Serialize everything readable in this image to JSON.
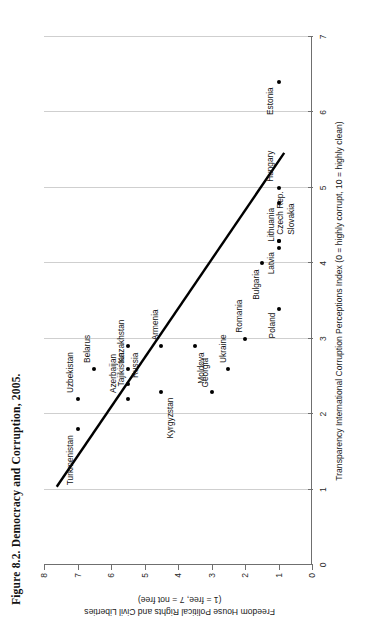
{
  "figure": {
    "title": "Figure 8.2.  Democracy and Corruption, 2005."
  },
  "chart_data": {
    "type": "scatter",
    "title": "Figure 8.2.  Democracy and Corruption, 2005.",
    "xlabel": "Transparency International Corruption Perceptions Index (0 = highly corrupt, 10 = highly clean)",
    "ylabel_line1": "Freedom House Political Rights and Civil Liberties",
    "ylabel_line2": "(1 = free, 7 = not free)",
    "xlim": [
      0,
      7
    ],
    "ylim": [
      0,
      8
    ],
    "y_inverted": false,
    "grid": "vertical",
    "legend": "none",
    "xticks": [
      0,
      1,
      2,
      3,
      4,
      5,
      6,
      7
    ],
    "yticks": [
      0,
      1,
      2,
      3,
      4,
      5,
      6,
      7,
      8
    ],
    "xticklabels": [
      "0",
      "1",
      "2",
      "3",
      "4",
      "5",
      "6",
      "7"
    ],
    "yticklabels": [
      "0",
      "1",
      "2",
      "3",
      "4",
      "5",
      "6",
      "7",
      "8"
    ],
    "points": [
      {
        "label": "Turkmenistan",
        "x": 1.8,
        "y": 7.0,
        "lx": -6,
        "ly": -13,
        "anchor": "end"
      },
      {
        "label": "Uzbekistan",
        "x": 2.2,
        "y": 7.0,
        "lx": 6,
        "ly": -13,
        "anchor": "start"
      },
      {
        "label": "Belarus",
        "x": 2.6,
        "y": 6.5,
        "lx": 6,
        "ly": -12,
        "anchor": "start"
      },
      {
        "label": "Tajikistan",
        "x": 2.9,
        "y": 5.5,
        "lx": -6,
        "ly": -12,
        "anchor": "end"
      },
      {
        "label": "Azerbaijan",
        "x": 2.2,
        "y": 5.5,
        "lx": 6,
        "ly": -20,
        "anchor": "start"
      },
      {
        "label": "Kazakhstan",
        "x": 2.6,
        "y": 5.5,
        "lx": 6,
        "ly": -12,
        "anchor": "start"
      },
      {
        "label": "Russia",
        "x": 2.4,
        "y": 5.5,
        "lx": 6,
        "ly": 2,
        "anchor": "start"
      },
      {
        "label": "Armenia",
        "x": 2.9,
        "y": 4.5,
        "lx": 6,
        "ly": -11,
        "anchor": "start"
      },
      {
        "label": "Kyrgyzstan",
        "x": 2.3,
        "y": 4.5,
        "lx": -6,
        "ly": 4,
        "anchor": "end"
      },
      {
        "label": "Moldova",
        "x": 2.9,
        "y": 3.5,
        "lx": -6,
        "ly": 1,
        "anchor": "end"
      },
      {
        "label": "Georgia",
        "x": 2.3,
        "y": 3.0,
        "lx": 4,
        "ly": -12,
        "anchor": "start"
      },
      {
        "label": "Ukraine",
        "x": 2.6,
        "y": 2.5,
        "lx": 6,
        "ly": -10,
        "anchor": "start"
      },
      {
        "label": "Romania",
        "x": 3.0,
        "y": 2.0,
        "lx": 6,
        "ly": -11,
        "anchor": "start"
      },
      {
        "label": "Bulgaria",
        "x": 4.0,
        "y": 1.5,
        "lx": -6,
        "ly": -11,
        "anchor": "end"
      },
      {
        "label": "Poland",
        "x": 3.4,
        "y": 1.0,
        "lx": -4,
        "ly": -12,
        "anchor": "end"
      },
      {
        "label": "Latvia",
        "x": 4.2,
        "y": 1.0,
        "lx": -4,
        "ly": -13,
        "anchor": "end"
      },
      {
        "label": "Slovakia",
        "x": 4.3,
        "y": 1.0,
        "lx": 6,
        "ly": 7,
        "anchor": "start"
      },
      {
        "label": "Czech Rep.",
        "x": 4.3,
        "y": 1.0,
        "lx": 6,
        "ly": -4,
        "anchor": "start"
      },
      {
        "label": "Hungary",
        "x": 5.0,
        "y": 1.0,
        "lx": 6,
        "ly": -14,
        "anchor": "start"
      },
      {
        "label": "Lithuania",
        "x": 4.8,
        "y": 1.0,
        "lx": -5,
        "ly": -13,
        "anchor": "end"
      },
      {
        "label": "Estonia",
        "x": 6.4,
        "y": 1.0,
        "lx": -5,
        "ly": -14,
        "anchor": "end"
      }
    ],
    "trendline": {
      "x0": 1.05,
      "y0": 7.6,
      "x1": 5.45,
      "y1": 0.85,
      "description": "downward fitted line from upper-left to lower-right"
    }
  }
}
